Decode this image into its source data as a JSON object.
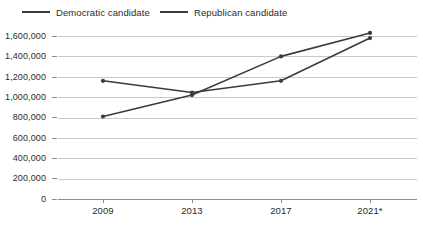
{
  "legend": {
    "items": [
      {
        "label": "Democratic candidate",
        "color": "#3b3b3b",
        "key": "democratic"
      },
      {
        "label": "Republican candidate",
        "color": "#3b3b3b",
        "key": "republican"
      }
    ]
  },
  "axes": {
    "y_tick_labels": [
      "1,600,000",
      "1,400,000",
      "1,200,000",
      "1,000,000",
      "800,000",
      "600,000",
      "400,000",
      "200,000",
      "0"
    ],
    "x_tick_labels": [
      "2009",
      "2013",
      "2017",
      "2021*"
    ]
  },
  "chart_data": {
    "type": "line",
    "title": "",
    "subtitle": "",
    "xlabel": "",
    "ylabel": "",
    "categories": [
      "2009",
      "2013",
      "2017",
      "2021*"
    ],
    "x_tick_labels": [
      "2009",
      "2013",
      "2017",
      "2021*"
    ],
    "y_tick_labels": [
      "0",
      "200,000",
      "400,000",
      "600,000",
      "800,000",
      "1,000,000",
      "1,200,000",
      "1,400,000",
      "1,600,000"
    ],
    "y_ticks": [
      0,
      200000,
      400000,
      600000,
      800000,
      1000000,
      1200000,
      1400000,
      1600000
    ],
    "ylim": [
      0,
      1600000
    ],
    "grid": true,
    "grid_axis": "y",
    "legend_position": "top-left",
    "markers": true,
    "series": [
      {
        "name": "Democratic candidate",
        "color": "#3b3b3b",
        "values": [
          1160000,
          1045000,
          1160000,
          1580000
        ]
      },
      {
        "name": "Republican candidate",
        "color": "#3b3b3b",
        "values": [
          810000,
          1020000,
          1400000,
          1630000
        ]
      }
    ],
    "annotations": [
      "2021* denotes provisional or projected figures"
    ]
  }
}
